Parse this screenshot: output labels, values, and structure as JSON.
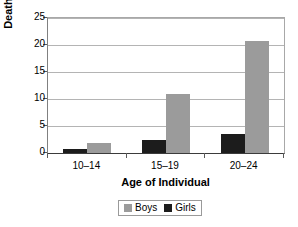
{
  "chart_data": {
    "type": "bar",
    "title": "",
    "subtitle": "",
    "xlabel": "Age of Individual",
    "ylabel": "Deaths per 100,000",
    "categories": [
      "10–14",
      "15–19",
      "20–24"
    ],
    "series": [
      {
        "name": "Girls",
        "color": "#1c1c1c",
        "values": [
          0.7,
          2.4,
          3.6
        ]
      },
      {
        "name": "Boys",
        "color": "#9b9b9b",
        "values": [
          1.8,
          11.0,
          20.7
        ]
      }
    ],
    "series_draw_order": [
      "Girls",
      "Boys"
    ],
    "ylim": [
      0,
      25
    ],
    "yticks": [
      0,
      5,
      10,
      15,
      20,
      25
    ],
    "ytick_labels": [
      "0",
      "5",
      "10",
      "15",
      "20",
      "25"
    ],
    "grid": true,
    "grid_axis": "y",
    "legend": {
      "position": "bottom-center",
      "entries": [
        "Boys",
        "Girls"
      ]
    }
  },
  "axis": {
    "y_title": "Deaths per 100,000",
    "x_title": "Age of Individual",
    "ytick_labels": [
      "25",
      "20",
      "15",
      "10",
      "5",
      "0"
    ],
    "xcat_labels": [
      "10–14",
      "15–19",
      "20–24"
    ]
  },
  "legend": {
    "entries": [
      {
        "label": "Boys",
        "color": "#9b9b9b"
      },
      {
        "label": "Girls",
        "color": "#1c1c1c"
      }
    ]
  },
  "colors": {
    "boys": "#9b9b9b",
    "girls": "#1c1c1c",
    "gridline": "#b4b4b4",
    "axis": "#3b3b3b",
    "background": "#ffffff"
  }
}
